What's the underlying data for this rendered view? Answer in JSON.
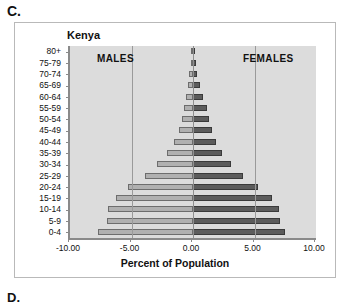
{
  "panel": {
    "label": "C.",
    "next_label": "D."
  },
  "chart_data": {
    "type": "bar",
    "subtype": "population-pyramid",
    "title": "Kenya",
    "xlabel": "Percent of Population",
    "ylabel": "",
    "xlim": [
      -10.0,
      10.0
    ],
    "xticks": [
      "-10.00",
      "-5.00",
      "0.00",
      "5.00",
      "10.00"
    ],
    "xtick_values": [
      -10,
      -5,
      0,
      5,
      10
    ],
    "grid": true,
    "grid_axis": "x",
    "legend_position": "in-plot",
    "categories": [
      "80+",
      "75-79",
      "70-74",
      "65-69",
      "60-64",
      "55-59",
      "50-54",
      "45-49",
      "40-44",
      "35-39",
      "30-34",
      "25-29",
      "20-24",
      "15-19",
      "10-14",
      "5-9",
      "0-4"
    ],
    "series": [
      {
        "name": "MALES",
        "side": "left",
        "color": "#b0b0b0",
        "values": [
          -0.15,
          -0.2,
          -0.3,
          -0.4,
          -0.55,
          -0.7,
          -0.9,
          -1.15,
          -1.55,
          -2.15,
          -2.95,
          -3.9,
          -5.3,
          -6.3,
          -6.9,
          -7.0,
          -7.7
        ]
      },
      {
        "name": "FEMALES",
        "side": "right",
        "color": "#5c5c5c",
        "values": [
          0.2,
          0.25,
          0.35,
          0.6,
          0.85,
          1.1,
          1.3,
          1.55,
          1.85,
          2.35,
          3.1,
          4.1,
          5.25,
          6.4,
          7.0,
          7.1,
          7.5
        ]
      }
    ],
    "annotations": [
      {
        "text": "MALES",
        "side": "left"
      },
      {
        "text": "FEMALES",
        "side": "right"
      }
    ]
  }
}
